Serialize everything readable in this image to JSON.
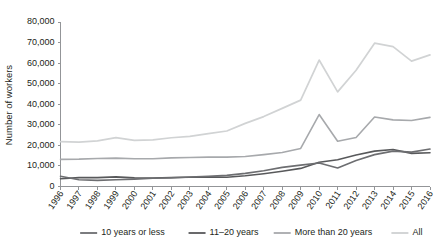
{
  "chart_data": {
    "type": "line",
    "title": "",
    "xlabel": "",
    "ylabel": "Number of workers",
    "ylim": [
      0,
      80000
    ],
    "ytick_labels": [
      "0",
      "10,000",
      "20,000",
      "30,000",
      "40,000",
      "50,000",
      "60,000",
      "70,000",
      "80,000"
    ],
    "ytick_values": [
      0,
      10000,
      20000,
      30000,
      40000,
      50000,
      60000,
      70000,
      80000
    ],
    "grid": false,
    "legend_position": "bottom",
    "x": [
      1996,
      1997,
      1998,
      1999,
      2000,
      2001,
      2002,
      2003,
      2004,
      2005,
      2006,
      2007,
      2008,
      2009,
      2010,
      2011,
      2012,
      2013,
      2014,
      2015,
      2016
    ],
    "categories": [
      "1996",
      "1997",
      "1998",
      "1999",
      "2000",
      "2001",
      "2002",
      "2003",
      "2004",
      "2005",
      "2006",
      "2007",
      "2008",
      "2009",
      "2010",
      "2011",
      "2012",
      "2013",
      "2014",
      "2015",
      "2016"
    ],
    "series": [
      {
        "name": "10 years or less",
        "color": "#6d6e71",
        "width": 1.6,
        "values": [
          5000,
          3300,
          3000,
          3300,
          3600,
          4000,
          4200,
          4600,
          5000,
          5400,
          6400,
          7700,
          9300,
          10400,
          11400,
          9000,
          12700,
          15500,
          17200,
          16700,
          18200
        ]
      },
      {
        "name": "11–20 years",
        "color": "#58595b",
        "width": 1.6,
        "values": [
          3800,
          4300,
          4300,
          4700,
          4200,
          4100,
          4400,
          4500,
          4700,
          4500,
          5200,
          6200,
          7400,
          8800,
          11800,
          13000,
          15300,
          17200,
          18000,
          16100,
          16400
        ]
      },
      {
        "name": "More than 20 years",
        "color": "#a7a9ac",
        "width": 1.6,
        "values": [
          13200,
          13300,
          13600,
          13800,
          13500,
          13500,
          13900,
          14100,
          14300,
          14300,
          14600,
          15500,
          16500,
          18500,
          35000,
          22000,
          23800,
          33800,
          32400,
          32100,
          33600
        ]
      },
      {
        "name": "All",
        "color": "#d1d3d4",
        "width": 1.7,
        "values": [
          21800,
          21600,
          22200,
          23800,
          22400,
          22700,
          23700,
          24400,
          25700,
          27000,
          30700,
          34000,
          38000,
          42000,
          61500,
          46000,
          56500,
          69700,
          68000,
          61000,
          64000
        ]
      }
    ]
  },
  "legend": {
    "items": [
      {
        "label": "10 years or less"
      },
      {
        "label": "11–20 years"
      },
      {
        "label": "More than 20 years"
      },
      {
        "label": "All"
      }
    ]
  }
}
